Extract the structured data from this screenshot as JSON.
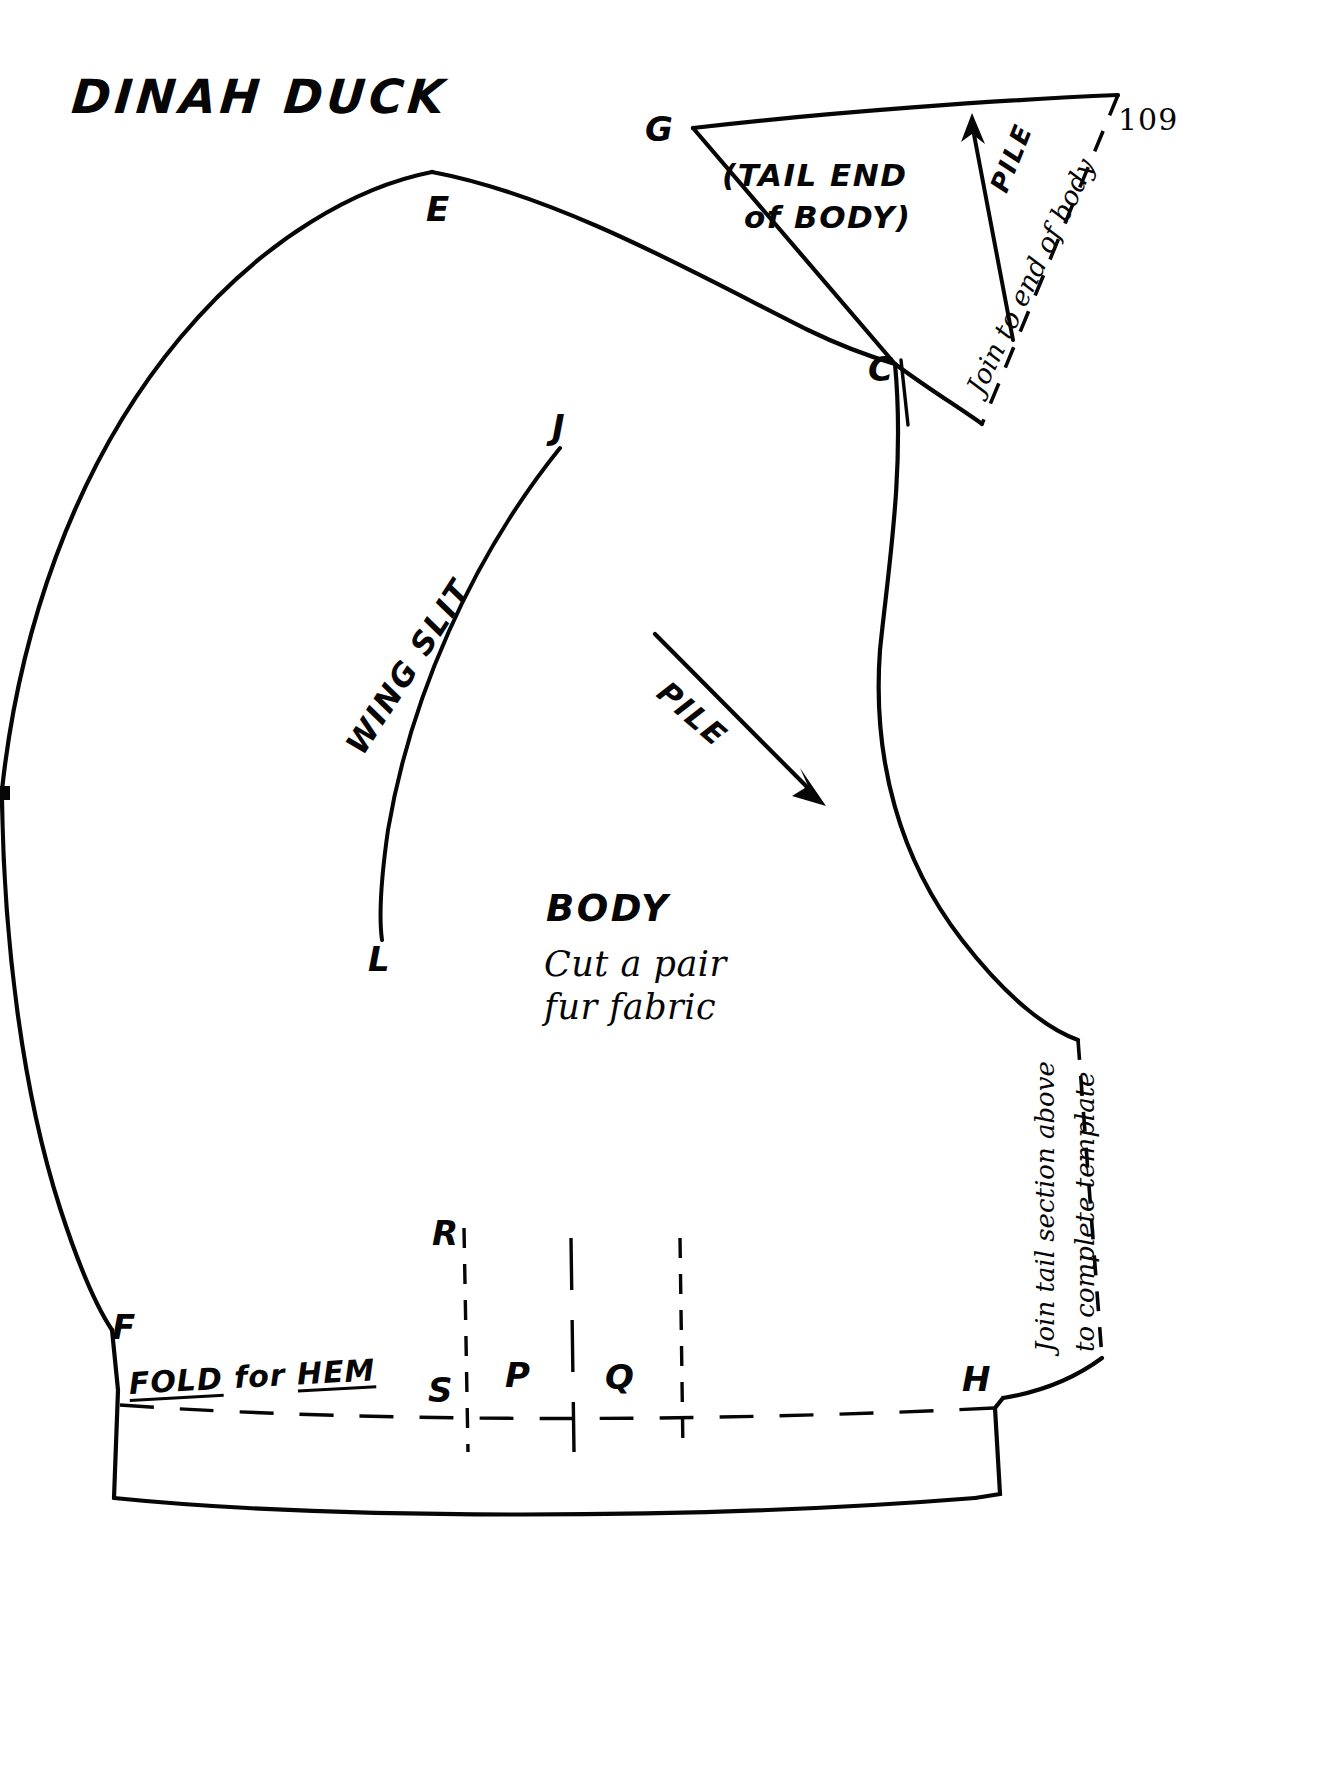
{
  "document": {
    "title": "DINAH DUCK",
    "page_number": "109"
  },
  "colors": {
    "ink": "#060606",
    "paper": "#ffffff"
  },
  "pattern": {
    "main_piece": {
      "name_label": "BODY",
      "instruction_lines": [
        "Cut a pair",
        "fur fabric"
      ],
      "grain_arrow_label": "PILE",
      "slit_label": "WING SLIT",
      "hem_label_parts": [
        {
          "text": "FOLD",
          "underline": true
        },
        {
          "text": " for ",
          "underline": false
        },
        {
          "text": "HEM",
          "underline": true
        }
      ],
      "hem_label_plain": "FOLD for HEM",
      "edge_note_lines": [
        "Join tail section above",
        "to complete template"
      ]
    },
    "tail_piece": {
      "name_lines": [
        "(TAIL END",
        "of BODY)"
      ],
      "grain_arrow_label": "PILE",
      "join_note": "Join to end of body"
    },
    "notation_points": [
      {
        "id": "E",
        "label": "E"
      },
      {
        "id": "G",
        "label": "G"
      },
      {
        "id": "C",
        "label": "C"
      },
      {
        "id": "J",
        "label": "J"
      },
      {
        "id": "L",
        "label": "L"
      },
      {
        "id": "F",
        "label": "F"
      },
      {
        "id": "R",
        "label": "R"
      },
      {
        "id": "S",
        "label": "S"
      },
      {
        "id": "P",
        "label": "P"
      },
      {
        "id": "Q",
        "label": "Q"
      },
      {
        "id": "H",
        "label": "H"
      }
    ]
  }
}
